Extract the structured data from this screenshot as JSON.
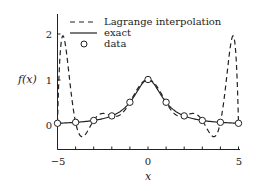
{
  "chart_data": {
    "type": "line",
    "title": "",
    "xlabel": "x",
    "ylabel": "f(x)",
    "xlim": [
      -5,
      5
    ],
    "ylim": [
      -0.3,
      2.3
    ],
    "xticks": [
      -5,
      0,
      5
    ],
    "xticks_minor": [
      -4,
      -3,
      -2,
      -1,
      1,
      2,
      3,
      4
    ],
    "yticks": [
      0,
      1,
      2
    ],
    "grid": false,
    "legend_position": "upper left (inside)",
    "series": [
      {
        "name": "Lagrange interpolation",
        "style": "dashed",
        "color": "#222222",
        "x": [
          -5,
          -4.8,
          -4.6,
          -4.4,
          -4.2,
          -4,
          -3.8,
          -3.5,
          -3,
          -2.5,
          -2,
          -1.5,
          -1,
          -0.5,
          0,
          0.5,
          1,
          1.5,
          2,
          2.5,
          3,
          3.5,
          3.8,
          4,
          4.2,
          4.4,
          4.6,
          4.8,
          5
        ],
        "y": [
          0.038,
          1.8,
          1.92,
          1.25,
          0.35,
          0.059,
          -0.25,
          -0.23,
          0.1,
          0.25,
          0.2,
          0.24,
          0.5,
          0.84,
          1.0,
          0.84,
          0.5,
          0.24,
          0.2,
          0.25,
          0.1,
          -0.23,
          -0.25,
          0.059,
          0.35,
          1.25,
          1.92,
          1.8,
          0.038
        ]
      },
      {
        "name": "exact",
        "style": "solid",
        "color": "#222222",
        "function": "1/(1+x^2)",
        "x": [
          -5,
          -4,
          -3,
          -2,
          -1.5,
          -1,
          -0.5,
          0,
          0.5,
          1,
          1.5,
          2,
          3,
          4,
          5
        ],
        "y": [
          0.038,
          0.059,
          0.1,
          0.2,
          0.308,
          0.5,
          0.8,
          1.0,
          0.8,
          0.5,
          0.308,
          0.2,
          0.1,
          0.059,
          0.038
        ]
      },
      {
        "name": "data",
        "style": "markers",
        "marker": "open-circle",
        "color": "#222222",
        "x": [
          -5,
          -4,
          -3,
          -2,
          -1,
          0,
          1,
          2,
          3,
          4,
          5
        ],
        "y": [
          0.038,
          0.059,
          0.1,
          0.2,
          0.5,
          1.0,
          0.5,
          0.2,
          0.1,
          0.059,
          0.038
        ]
      }
    ],
    "legend": [
      {
        "label": "Lagrange interpolation",
        "style": "dashed"
      },
      {
        "label": "exact",
        "style": "solid"
      },
      {
        "label": "data",
        "style": "open-circle"
      }
    ]
  },
  "labels": {
    "x_axis": "x",
    "y_axis": "f(x)",
    "x_tick_neg5": "−5",
    "x_tick_0": "0",
    "x_tick_5": "5",
    "y_tick_0": "0",
    "y_tick_1": "1",
    "y_tick_2": "2",
    "legend_lagrange": "Lagrange interpolation",
    "legend_exact": "exact",
    "legend_data": "data"
  }
}
